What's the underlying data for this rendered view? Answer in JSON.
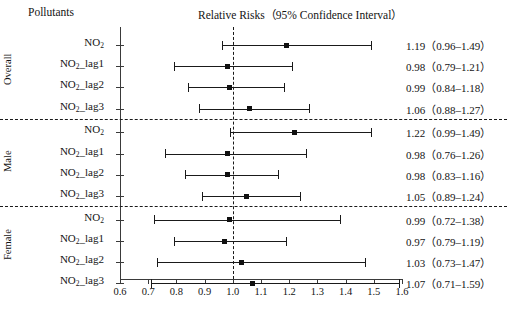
{
  "header": {
    "left_column_title": "Pollutants",
    "plot_title": "Relative Risks（95% Confidence Interval）"
  },
  "axis": {
    "ticks": [
      "0.6",
      "0.7",
      "0.8",
      "0.9",
      "1.0",
      "1.1",
      "1.2",
      "1.3",
      "1.4",
      "1.5",
      "1.6"
    ],
    "min": 0.6,
    "max": 1.6,
    "reference_value": 1.0
  },
  "groups": [
    {
      "name": "Overall",
      "rows": [
        {
          "pollutant": "NO",
          "sub": "2",
          "suffix": "",
          "estimate": 1.19,
          "low": 0.96,
          "high": 1.49,
          "value_text": "1.19（0.96–1.49）"
        },
        {
          "pollutant": "NO",
          "sub": "2",
          "suffix": "_lag1",
          "estimate": 0.98,
          "low": 0.79,
          "high": 1.21,
          "value_text": "0.98（0.79–1.21）"
        },
        {
          "pollutant": "NO",
          "sub": "2",
          "suffix": "_lag2",
          "estimate": 0.99,
          "low": 0.84,
          "high": 1.18,
          "value_text": "0.99（0.84–1.18）"
        },
        {
          "pollutant": "NO",
          "sub": "2",
          "suffix": "_lag3",
          "estimate": 1.06,
          "low": 0.88,
          "high": 1.27,
          "value_text": "1.06（0.88–1.27）"
        }
      ]
    },
    {
      "name": "Male",
      "rows": [
        {
          "pollutant": "NO",
          "sub": "2",
          "suffix": "",
          "estimate": 1.22,
          "low": 0.99,
          "high": 1.49,
          "value_text": "1.22（0.99–1.49）"
        },
        {
          "pollutant": "NO",
          "sub": "2",
          "suffix": "_lag1",
          "estimate": 0.98,
          "low": 0.76,
          "high": 1.26,
          "value_text": "0.98（0.76–1.26）"
        },
        {
          "pollutant": "NO",
          "sub": "2",
          "suffix": "_lag2",
          "estimate": 0.98,
          "low": 0.83,
          "high": 1.16,
          "value_text": "0.98（0.83–1.16）"
        },
        {
          "pollutant": "NO",
          "sub": "2",
          "suffix": "_lag3",
          "estimate": 1.05,
          "low": 0.89,
          "high": 1.24,
          "value_text": "1.05（0.89–1.24）"
        }
      ]
    },
    {
      "name": "Female",
      "rows": [
        {
          "pollutant": "NO",
          "sub": "2",
          "suffix": "",
          "estimate": 0.99,
          "low": 0.72,
          "high": 1.38,
          "value_text": "0.99（0.72–1.38）"
        },
        {
          "pollutant": "NO",
          "sub": "2",
          "suffix": "_lag1",
          "estimate": 0.97,
          "low": 0.79,
          "high": 1.19,
          "value_text": "0.97（0.79–1.19）"
        },
        {
          "pollutant": "NO",
          "sub": "2",
          "suffix": "_lag2",
          "estimate": 1.03,
          "low": 0.73,
          "high": 1.47,
          "value_text": "1.03（0.73–1.47）"
        },
        {
          "pollutant": "NO",
          "sub": "2",
          "suffix": "_lag3",
          "estimate": 1.07,
          "low": 0.71,
          "high": 1.59,
          "value_text": "1.07（0.71–1.59）"
        }
      ]
    }
  ],
  "chart_data": {
    "type": "scatter",
    "title": "Relative Risks（95% Confidence Interval）",
    "xlabel": "",
    "ylabel": "Pollutants",
    "xlim": [
      0.6,
      1.6
    ],
    "grid": false,
    "legend": "none",
    "reference_line": 1.0,
    "categories": [
      "Overall NO2",
      "Overall NO2_lag1",
      "Overall NO2_lag2",
      "Overall NO2_lag3",
      "Male NO2",
      "Male NO2_lag1",
      "Male NO2_lag2",
      "Male NO2_lag3",
      "Female NO2",
      "Female NO2_lag1",
      "Female NO2_lag2",
      "Female NO2_lag3"
    ],
    "values": [
      1.19,
      0.98,
      0.99,
      1.06,
      1.22,
      0.98,
      0.98,
      1.05,
      0.99,
      0.97,
      1.03,
      1.07
    ],
    "ci_low": [
      0.96,
      0.79,
      0.84,
      0.88,
      0.99,
      0.76,
      0.83,
      0.89,
      0.72,
      0.79,
      0.73,
      0.71
    ],
    "ci_high": [
      1.49,
      1.21,
      1.18,
      1.27,
      1.49,
      1.26,
      1.16,
      1.24,
      1.38,
      1.19,
      1.47,
      1.59
    ],
    "xticks": [
      0.6,
      0.7,
      0.8,
      0.9,
      1.0,
      1.1,
      1.2,
      1.3,
      1.4,
      1.5,
      1.6
    ]
  }
}
